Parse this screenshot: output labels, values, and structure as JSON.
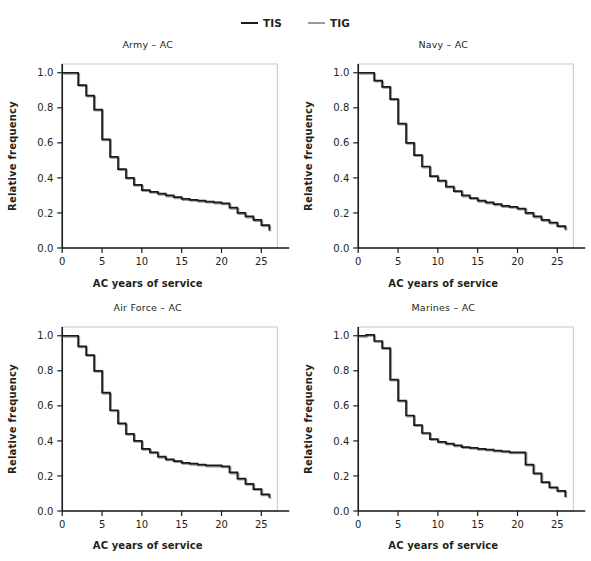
{
  "figure": {
    "background_color": "#ffffff",
    "legend": {
      "position": "top-center",
      "entries": [
        {
          "label": "TIS",
          "color": "#1a1a1a",
          "icon": "line-swatch"
        },
        {
          "label": "TIG",
          "color": "#9a9a9a",
          "icon": "line-swatch"
        }
      ]
    }
  },
  "chart_data": [
    {
      "type": "line",
      "title": "Army – AC",
      "xlabel": "AC years of service",
      "ylabel": "Relative frequency",
      "xlim": [
        0,
        27
      ],
      "ylim": [
        0,
        1.05
      ],
      "xticks": [
        0,
        5,
        10,
        15,
        20,
        25
      ],
      "yticks": [
        0.0,
        0.2,
        0.4,
        0.6,
        0.8,
        1.0
      ],
      "xticklabels": [
        "0",
        "5",
        "10",
        "15",
        "20",
        "25"
      ],
      "yticklabels": [
        "0.0",
        "0.2",
        "0.4",
        "0.6",
        "0.8",
        "1.0"
      ],
      "grid": false,
      "drawstyle": "steps-post",
      "x": [
        0,
        1,
        2,
        3,
        4,
        5,
        6,
        7,
        8,
        9,
        10,
        11,
        12,
        13,
        14,
        15,
        16,
        17,
        18,
        19,
        20,
        21,
        22,
        23,
        24,
        25,
        26
      ],
      "series": [
        {
          "name": "TIS",
          "color": "#1a1a1a",
          "values": [
            1.0,
            1.0,
            0.93,
            0.87,
            0.79,
            0.62,
            0.52,
            0.45,
            0.4,
            0.36,
            0.33,
            0.32,
            0.31,
            0.3,
            0.29,
            0.28,
            0.275,
            0.27,
            0.265,
            0.26,
            0.255,
            0.23,
            0.2,
            0.18,
            0.16,
            0.13,
            0.1
          ]
        },
        {
          "name": "TIG",
          "color": "#9a9a9a",
          "values": [
            1.0,
            1.0,
            0.93,
            0.87,
            0.79,
            0.62,
            0.52,
            0.45,
            0.4,
            0.36,
            0.33,
            0.32,
            0.31,
            0.3,
            0.29,
            0.28,
            0.275,
            0.27,
            0.265,
            0.26,
            0.255,
            0.23,
            0.2,
            0.18,
            0.16,
            0.13,
            0.1
          ]
        }
      ]
    },
    {
      "type": "line",
      "title": "Navy – AC",
      "xlabel": "AC years of service",
      "ylabel": "Relative frequency",
      "xlim": [
        0,
        27
      ],
      "ylim": [
        0,
        1.05
      ],
      "xticks": [
        0,
        5,
        10,
        15,
        20,
        25
      ],
      "yticks": [
        0.0,
        0.2,
        0.4,
        0.6,
        0.8,
        1.0
      ],
      "xticklabels": [
        "0",
        "5",
        "10",
        "15",
        "20",
        "25"
      ],
      "yticklabels": [
        "0.0",
        "0.2",
        "0.4",
        "0.6",
        "0.8",
        "1.0"
      ],
      "grid": false,
      "drawstyle": "steps-post",
      "x": [
        0,
        1,
        2,
        3,
        4,
        5,
        6,
        7,
        8,
        9,
        10,
        11,
        12,
        13,
        14,
        15,
        16,
        17,
        18,
        19,
        20,
        21,
        22,
        23,
        24,
        25,
        26
      ],
      "series": [
        {
          "name": "TIS",
          "color": "#1a1a1a",
          "values": [
            1.0,
            1.0,
            0.955,
            0.92,
            0.85,
            0.71,
            0.6,
            0.53,
            0.465,
            0.41,
            0.385,
            0.35,
            0.325,
            0.3,
            0.285,
            0.27,
            0.26,
            0.25,
            0.24,
            0.235,
            0.225,
            0.2,
            0.18,
            0.16,
            0.145,
            0.125,
            0.105
          ]
        },
        {
          "name": "TIG",
          "color": "#9a9a9a",
          "values": [
            1.0,
            1.0,
            0.955,
            0.92,
            0.85,
            0.71,
            0.6,
            0.53,
            0.465,
            0.41,
            0.385,
            0.35,
            0.325,
            0.3,
            0.285,
            0.27,
            0.26,
            0.25,
            0.24,
            0.235,
            0.225,
            0.2,
            0.18,
            0.16,
            0.145,
            0.125,
            0.105
          ]
        }
      ]
    },
    {
      "type": "line",
      "title": "Air Force – AC",
      "xlabel": "AC years of service",
      "ylabel": "Relative frequency",
      "xlim": [
        0,
        27
      ],
      "ylim": [
        0,
        1.05
      ],
      "xticks": [
        0,
        5,
        10,
        15,
        20,
        25
      ],
      "yticks": [
        0.0,
        0.2,
        0.4,
        0.6,
        0.8,
        1.0
      ],
      "xticklabels": [
        "0",
        "5",
        "10",
        "15",
        "20",
        "25"
      ],
      "yticklabels": [
        "0.0",
        "0.2",
        "0.4",
        "0.6",
        "0.8",
        "1.0"
      ],
      "grid": false,
      "drawstyle": "steps-post",
      "x": [
        0,
        1,
        2,
        3,
        4,
        5,
        6,
        7,
        8,
        9,
        10,
        11,
        12,
        13,
        14,
        15,
        16,
        17,
        18,
        19,
        20,
        21,
        22,
        23,
        24,
        25,
        26
      ],
      "series": [
        {
          "name": "TIS",
          "color": "#1a1a1a",
          "values": [
            1.0,
            1.0,
            0.94,
            0.89,
            0.8,
            0.675,
            0.575,
            0.5,
            0.44,
            0.4,
            0.355,
            0.335,
            0.31,
            0.295,
            0.285,
            0.275,
            0.27,
            0.265,
            0.26,
            0.26,
            0.255,
            0.22,
            0.185,
            0.155,
            0.125,
            0.095,
            0.075
          ]
        },
        {
          "name": "TIG",
          "color": "#9a9a9a",
          "values": [
            1.0,
            1.0,
            0.94,
            0.89,
            0.8,
            0.675,
            0.575,
            0.5,
            0.44,
            0.4,
            0.355,
            0.335,
            0.31,
            0.295,
            0.285,
            0.275,
            0.27,
            0.265,
            0.26,
            0.26,
            0.255,
            0.22,
            0.185,
            0.155,
            0.125,
            0.095,
            0.075
          ]
        }
      ]
    },
    {
      "type": "line",
      "title": "Marines – AC",
      "xlabel": "AC years of service",
      "ylabel": "Relative frequency",
      "xlim": [
        0,
        27
      ],
      "ylim": [
        0,
        1.05
      ],
      "xticks": [
        0,
        5,
        10,
        15,
        20,
        25
      ],
      "yticks": [
        0.0,
        0.2,
        0.4,
        0.6,
        0.8,
        1.0
      ],
      "xticklabels": [
        "0",
        "5",
        "10",
        "15",
        "20",
        "25"
      ],
      "yticklabels": [
        "0.0",
        "0.2",
        "0.4",
        "0.6",
        "0.8",
        "1.0"
      ],
      "grid": false,
      "drawstyle": "steps-post",
      "x": [
        0,
        1,
        2,
        3,
        4,
        5,
        6,
        7,
        8,
        9,
        10,
        11,
        12,
        13,
        14,
        15,
        16,
        17,
        18,
        19,
        20,
        21,
        22,
        23,
        24,
        25,
        26
      ],
      "series": [
        {
          "name": "TIS",
          "color": "#1a1a1a",
          "values": [
            1.0,
            1.005,
            0.97,
            0.93,
            0.75,
            0.63,
            0.545,
            0.49,
            0.445,
            0.41,
            0.395,
            0.385,
            0.375,
            0.365,
            0.36,
            0.355,
            0.35,
            0.345,
            0.34,
            0.335,
            0.335,
            0.265,
            0.215,
            0.165,
            0.135,
            0.115,
            0.08
          ]
        },
        {
          "name": "TIG",
          "color": "#9a9a9a",
          "values": [
            1.0,
            1.005,
            0.97,
            0.93,
            0.75,
            0.63,
            0.545,
            0.49,
            0.445,
            0.41,
            0.395,
            0.385,
            0.375,
            0.365,
            0.36,
            0.355,
            0.35,
            0.345,
            0.34,
            0.335,
            0.335,
            0.265,
            0.215,
            0.165,
            0.135,
            0.115,
            0.08
          ]
        }
      ]
    }
  ]
}
